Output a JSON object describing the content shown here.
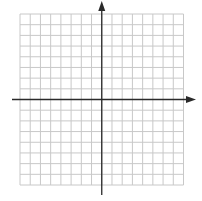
{
  "diagram": {
    "type": "coordinate-plane",
    "grid": {
      "columns": 16,
      "rows": 16,
      "columns_left_of_y_axis": 8,
      "rows_above_x_axis": 8,
      "line_color": "#c8c8c8"
    },
    "axes": {
      "color": "#2a2a2a",
      "x_axis": {
        "arrow": "right",
        "labels": []
      },
      "y_axis": {
        "arrow": "up",
        "labels": []
      }
    },
    "tick_labels": [],
    "points": []
  }
}
